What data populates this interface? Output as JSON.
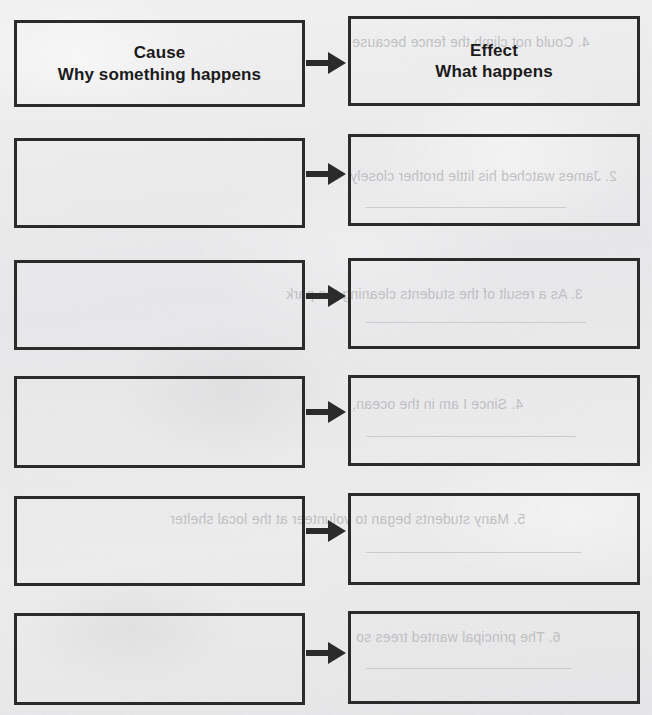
{
  "document": {
    "type": "cause-and-effect graphic organizer worksheet",
    "background_color": "#ececed",
    "ink_color": "#2b2b2b",
    "bleed_text_color": "#b9b9bc"
  },
  "header_row": {
    "cause": {
      "line1": "Cause",
      "line2": "Why something happens"
    },
    "effect": {
      "line1": "Effect",
      "line2": "What happens"
    },
    "connector": "right-arrow"
  },
  "rows": [
    {
      "index": 1,
      "cause_text": "",
      "effect_text": "",
      "connector": "right-arrow",
      "top": 20,
      "height": 87
    },
    {
      "index": 2,
      "cause_text": "",
      "effect_text": "",
      "connector": "right-arrow",
      "top": 138,
      "height": 90
    },
    {
      "index": 3,
      "cause_text": "",
      "effect_text": "",
      "connector": "right-arrow",
      "top": 260,
      "height": 90
    },
    {
      "index": 4,
      "cause_text": "",
      "effect_text": "",
      "connector": "right-arrow",
      "top": 376,
      "height": 92
    },
    {
      "index": 5,
      "cause_text": "",
      "effect_text": "",
      "connector": "right-arrow",
      "top": 496,
      "height": 90
    },
    {
      "index": 6,
      "cause_text": "",
      "effect_text": "",
      "connector": "right-arrow",
      "top": 613,
      "height": 92
    }
  ],
  "bleed_through": {
    "note": "faint mirrored show-through text from the reverse side of the scanned page",
    "lines": [
      {
        "text": "4.  Could not climb the fence because",
        "x": 352,
        "y": 34,
        "size": 14
      },
      {
        "text": "2.  James watched his little brother closely",
        "x": 350,
        "y": 168,
        "size": 14
      },
      {
        "text": "3.  As a result of the students cleaning the park",
        "x": 286,
        "y": 286,
        "size": 14
      },
      {
        "text": "4.  Since I am in the ocean,",
        "x": 352,
        "y": 396,
        "size": 14
      },
      {
        "text": "5.  Many students began to volunteer at the local shelter",
        "x": 170,
        "y": 511,
        "size": 14
      },
      {
        "text": "6.  The principal wanted trees so",
        "x": 356,
        "y": 629,
        "size": 14
      }
    ],
    "rules": [
      {
        "x": 366,
        "y": 207,
        "width": 200
      },
      {
        "x": 366,
        "y": 322,
        "width": 220
      },
      {
        "x": 366,
        "y": 436,
        "width": 210
      },
      {
        "x": 366,
        "y": 552,
        "width": 215
      },
      {
        "x": 366,
        "y": 668,
        "width": 205
      }
    ]
  }
}
